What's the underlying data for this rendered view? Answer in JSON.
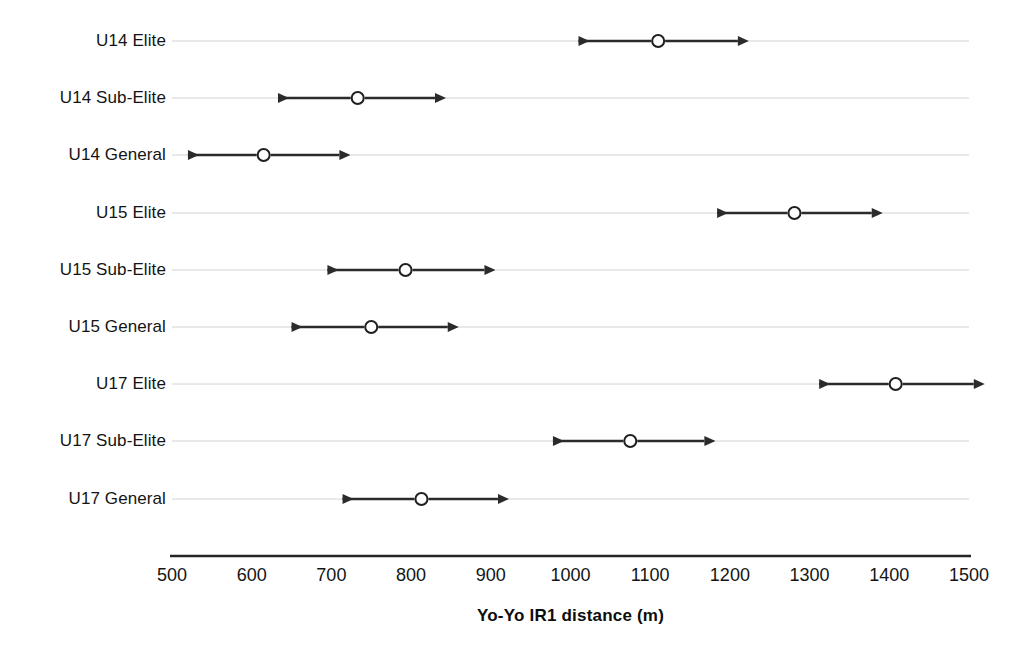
{
  "chart_data": {
    "type": "scatter",
    "title": "",
    "subtitle": "",
    "xlabel": "Yo-Yo IR1 distance (m)",
    "ylabel": "",
    "xlim": [
      500,
      1500
    ],
    "xticks": [
      500,
      600,
      700,
      800,
      900,
      1000,
      1100,
      1200,
      1300,
      1400,
      1500
    ],
    "xtick_labels": [
      "500",
      "600",
      "700",
      "800",
      "900",
      "1000",
      "1100",
      "1200",
      "1300",
      "1400",
      "1500"
    ],
    "grid": true,
    "grid_orientation": "horizontal",
    "legend": "none",
    "annotations": [],
    "marker_style": "open-circle",
    "whisker_style": "double-headed-arrow",
    "categories": [
      "U14 Elite",
      "U14 Sub-Elite",
      "U14 General",
      "U15 Elite",
      "U15 Sub-Elite",
      "U15 General",
      "U17 Elite",
      "U17 Sub-Elite",
      "U17 General"
    ],
    "series": [
      {
        "name": "Yo-Yo IR1 distance (m)",
        "points": [
          {
            "category": "U14 Elite",
            "mean": 1110,
            "low": 1010,
            "high": 1210
          },
          {
            "category": "U14 Sub-Elite",
            "mean": 733,
            "low": 633,
            "high": 830
          },
          {
            "category": "U14 General",
            "mean": 615,
            "low": 520,
            "high": 710
          },
          {
            "category": "U15 Elite",
            "mean": 1281,
            "low": 1184,
            "high": 1378
          },
          {
            "category": "U15 Sub-Elite",
            "mean": 793,
            "low": 695,
            "high": 892
          },
          {
            "category": "U15 General",
            "mean": 750,
            "low": 650,
            "high": 846
          },
          {
            "category": "U17 Elite",
            "mean": 1408,
            "low": 1312,
            "high": 1506
          },
          {
            "category": "U17 Sub-Elite",
            "mean": 1075,
            "low": 978,
            "high": 1168
          },
          {
            "category": "U17 General",
            "mean": 813,
            "low": 714,
            "high": 909
          }
        ]
      }
    ]
  },
  "style": {
    "line_color": "#2b2b2b",
    "grid_color": "#d2d2d2",
    "axis_color": "#242424",
    "marker_fill": "#ffffff",
    "marker_stroke": "#1f1f1f",
    "text_color": "#141414",
    "background": "#ffffff"
  },
  "geometry": {
    "plot_left": 172,
    "plot_right": 969,
    "row_y": [
      41,
      98,
      155,
      213,
      270,
      327,
      384,
      441,
      499
    ],
    "label_right": 166,
    "axis_y": 556,
    "tick_label_y": 566,
    "axis_title_y": 607
  }
}
